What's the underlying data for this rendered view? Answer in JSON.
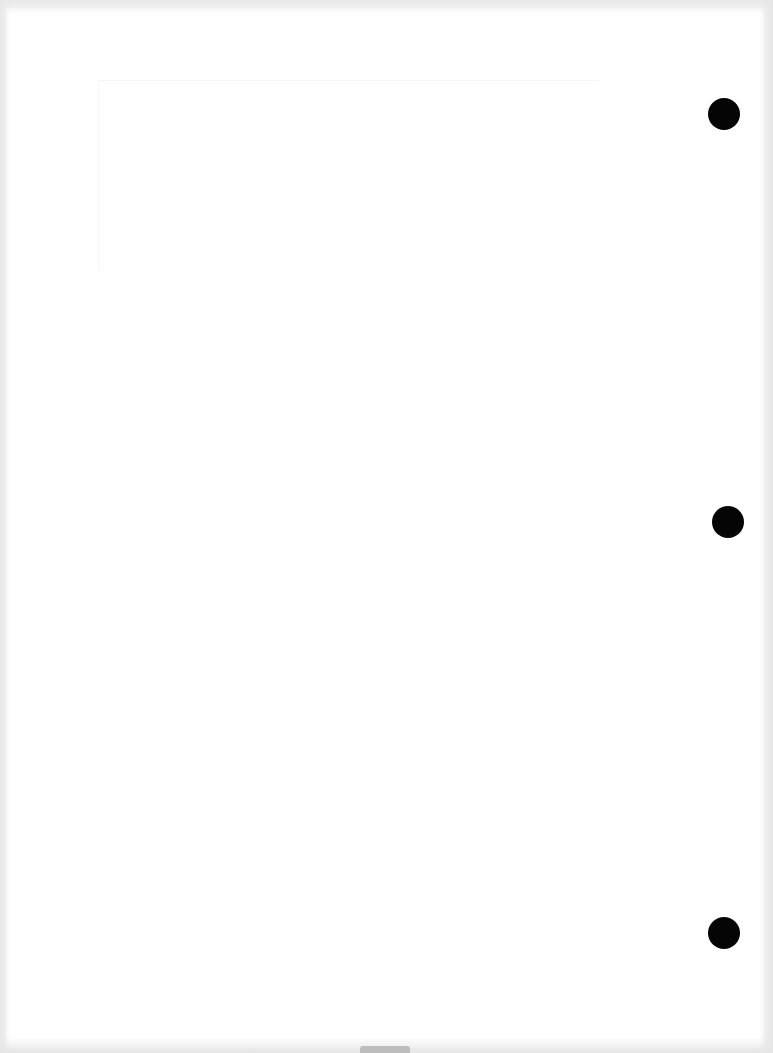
{
  "document": {
    "type": "blank scanned page",
    "text": "",
    "punch_holes": 3,
    "colors": {
      "paper": "#ffffff",
      "scan_edge": "#f1f1f1",
      "hole": "#050505"
    }
  }
}
